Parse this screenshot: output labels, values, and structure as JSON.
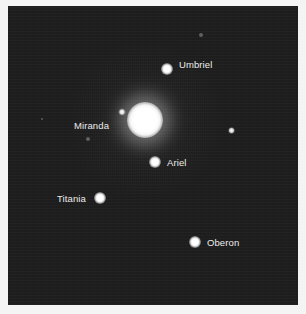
{
  "image": {
    "subject": "Uranus and its five major moons",
    "planet": "Uranus",
    "moons": [
      {
        "name": "Umbriel"
      },
      {
        "name": "Miranda"
      },
      {
        "name": "Ariel"
      },
      {
        "name": "Titania"
      },
      {
        "name": "Oberon"
      }
    ]
  },
  "labels": {
    "umbriel": "Umbriel",
    "miranda": "Miranda",
    "ariel": "Ariel",
    "titania": "Titania",
    "oberon": "Oberon"
  },
  "colors": {
    "sky": "#1e1e1e",
    "border": "#f4f4f4",
    "label_text": "#ececec"
  }
}
